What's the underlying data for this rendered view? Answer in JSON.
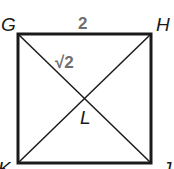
{
  "diagram": {
    "type": "square-with-diagonals",
    "vertices": {
      "top_left": "G",
      "top_right": "H",
      "bottom_left": "K",
      "bottom_right": "J",
      "center": "L"
    },
    "measurements": {
      "side_GH": "2",
      "half_diagonal_GL": "√2"
    },
    "colors": {
      "stroke": "#1a1a1a",
      "measure_text": "#6e6e6e"
    }
  }
}
